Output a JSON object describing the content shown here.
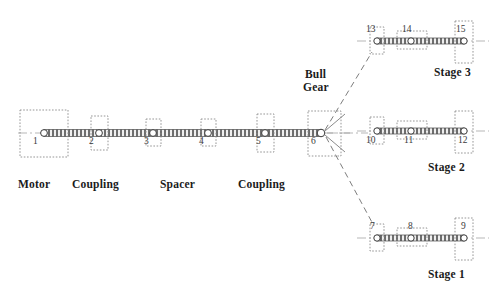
{
  "figure": {
    "background": "#ffffff",
    "line_color": "#555555",
    "text_color": "#1b1b1b"
  },
  "main_shaft": {
    "label_motor": "Motor",
    "label_coupling_1": "Coupling",
    "label_spacer": "Spacer",
    "label_coupling_2": "Coupling",
    "nodes": [
      {
        "id": "1",
        "x": 44,
        "y": 133,
        "kind": "motor-block"
      },
      {
        "id": "2",
        "x": 99,
        "y": 133,
        "kind": "coupling-box"
      },
      {
        "id": "3",
        "x": 153,
        "y": 133,
        "kind": "bearing-box"
      },
      {
        "id": "4",
        "x": 208,
        "y": 133,
        "kind": "bearing-box"
      },
      {
        "id": "5",
        "x": 265,
        "y": 133,
        "kind": "coupling-box"
      },
      {
        "id": "6",
        "x": 321,
        "y": 133,
        "kind": "bull-gear"
      }
    ]
  },
  "bull_gear": {
    "label_line_1": "Bull",
    "label_line_2": "Gear",
    "node_id": "6"
  },
  "stages": [
    {
      "name": "Stage 3",
      "y": 41,
      "nodes": [
        {
          "id": "13",
          "x": 377,
          "kind": "bearing-box"
        },
        {
          "id": "14",
          "x": 411,
          "kind": "pinion-gear"
        },
        {
          "id": "15",
          "x": 464,
          "kind": "impeller-box"
        }
      ]
    },
    {
      "name": "Stage 2",
      "y": 131,
      "nodes": [
        {
          "id": "10",
          "x": 377,
          "kind": "bearing-box"
        },
        {
          "id": "11",
          "x": 411,
          "kind": "pinion-gear"
        },
        {
          "id": "12",
          "x": 464,
          "kind": "impeller-box"
        }
      ]
    },
    {
      "name": "Stage 1",
      "y": 238,
      "nodes": [
        {
          "id": "7",
          "x": 377,
          "kind": "bearing-box"
        },
        {
          "id": "8",
          "x": 411,
          "kind": "pinion-gear"
        },
        {
          "id": "9",
          "x": 464,
          "kind": "impeller-box"
        }
      ]
    }
  ]
}
